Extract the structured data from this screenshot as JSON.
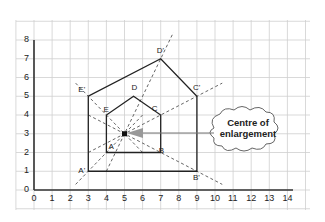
{
  "diagram": {
    "type": "enlargement-on-grid",
    "x_axis": {
      "min": 0,
      "max": 14,
      "ticks": [
        "0",
        "1",
        "2",
        "3",
        "4",
        "5",
        "6",
        "7",
        "8",
        "9",
        "10",
        "11",
        "12",
        "13",
        "14"
      ]
    },
    "y_axis": {
      "min": 0,
      "max": 8,
      "ticks": [
        "0",
        "1",
        "2",
        "3",
        "4",
        "5",
        "6",
        "7",
        "8"
      ]
    },
    "object_shape": {
      "points": [
        {
          "label": "A",
          "x": 4,
          "y": 2
        },
        {
          "label": "B",
          "x": 7,
          "y": 2
        },
        {
          "label": "C",
          "x": 7,
          "y": 4
        },
        {
          "label": "D",
          "x": 5.5,
          "y": 5
        },
        {
          "label": "E",
          "x": 4,
          "y": 4
        }
      ]
    },
    "image_shape": {
      "points": [
        {
          "label": "A'",
          "x": 3,
          "y": 1
        },
        {
          "label": "B'",
          "x": 9,
          "y": 1
        },
        {
          "label": "C'",
          "x": 9,
          "y": 5
        },
        {
          "label": "D'",
          "x": 7,
          "y": 7
        },
        {
          "label": "E'",
          "x": 3,
          "y": 5
        }
      ]
    },
    "centre": {
      "x": 5,
      "y": 3
    },
    "callout": {
      "line1": "Centre of",
      "line2": "enlargement"
    },
    "colors": {
      "grid": "#c8c8c8",
      "axis": "#333333",
      "shape": "#222222",
      "ray": "#666666",
      "arrow": "#888888"
    }
  }
}
